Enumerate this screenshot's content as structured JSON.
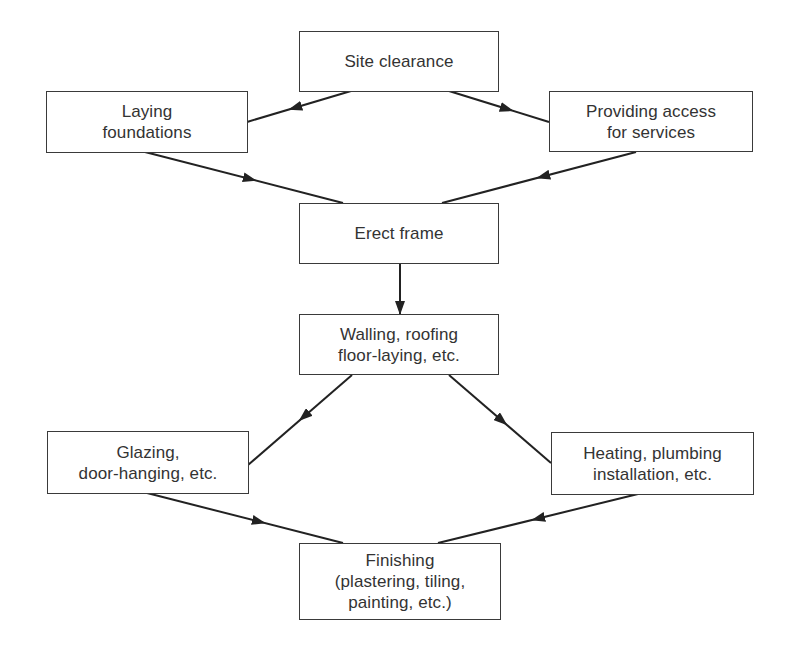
{
  "diagram": {
    "type": "flowchart",
    "nodes": {
      "site_clearance": {
        "lines": [
          "Site clearance"
        ]
      },
      "laying_foundations": {
        "lines": [
          "Laying",
          "foundations"
        ]
      },
      "providing_access": {
        "lines": [
          "Providing access",
          "for services"
        ]
      },
      "erect_frame": {
        "lines": [
          "Erect frame"
        ]
      },
      "walling_roofing": {
        "lines": [
          "Walling, roofing",
          "floor-laying, etc."
        ]
      },
      "glazing": {
        "lines": [
          "Glazing,",
          "door-hanging, etc."
        ]
      },
      "heating_plumbing": {
        "lines": [
          "Heating, plumbing",
          "installation, etc."
        ]
      },
      "finishing": {
        "lines": [
          "Finishing",
          "(plastering, tiling,",
          "painting, etc.)"
        ]
      }
    },
    "edges": [
      {
        "from": "site_clearance",
        "to": "laying_foundations"
      },
      {
        "from": "site_clearance",
        "to": "providing_access"
      },
      {
        "from": "laying_foundations",
        "to": "erect_frame"
      },
      {
        "from": "providing_access",
        "to": "erect_frame"
      },
      {
        "from": "erect_frame",
        "to": "walling_roofing"
      },
      {
        "from": "walling_roofing",
        "to": "glazing"
      },
      {
        "from": "walling_roofing",
        "to": "heating_plumbing"
      },
      {
        "from": "glazing",
        "to": "finishing"
      },
      {
        "from": "heating_plumbing",
        "to": "finishing"
      }
    ],
    "colors": {
      "line": "#222222",
      "border": "#3a3a3a",
      "text": "#333333",
      "background": "#ffffff"
    }
  }
}
